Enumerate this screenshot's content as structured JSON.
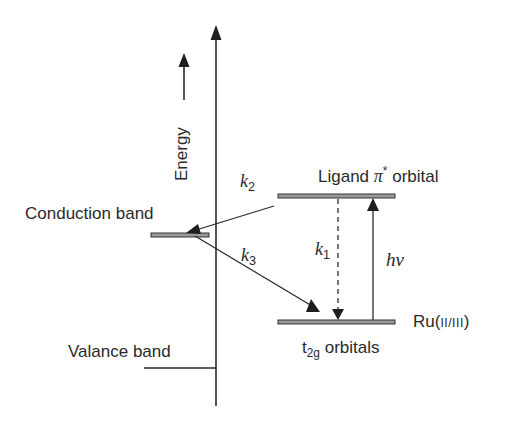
{
  "diagram": {
    "type": "energy-level-diagram",
    "axis": {
      "label": "Energy",
      "direction": "up"
    },
    "levels": [
      {
        "id": "conduction_band",
        "label": "Conduction band"
      },
      {
        "id": "valance_band",
        "label": "Valance band"
      },
      {
        "id": "ligand_pi_star",
        "label_prefix": "Ligand ",
        "label_symbol": "π",
        "label_sup": "*",
        "label_suffix": " orbital"
      },
      {
        "id": "t2g",
        "label_main": "t",
        "label_sub": "2g",
        "label_suffix": " orbitals",
        "side_label_main": "Ru(",
        "side_label_oxidation": "II/III",
        "side_label_close": ")"
      }
    ],
    "transitions": [
      {
        "id": "k1",
        "symbol": "k",
        "sub": "1",
        "from": "ligand_pi_star",
        "to": "t2g",
        "style": "dashed"
      },
      {
        "id": "k2",
        "symbol": "k",
        "sub": "2",
        "from": "ligand_pi_star",
        "to": "conduction_band",
        "style": "solid"
      },
      {
        "id": "k3",
        "symbol": "k",
        "sub": "3",
        "from": "conduction_band",
        "to": "t2g",
        "style": "solid"
      },
      {
        "id": "hv",
        "symbol": "hν",
        "from": "t2g",
        "to": "ligand_pi_star",
        "style": "solid"
      }
    ],
    "colors": {
      "line": "#2a2a2a",
      "bar_fill": "#9a9a9a",
      "background": "#ffffff"
    }
  }
}
